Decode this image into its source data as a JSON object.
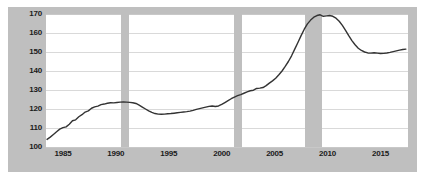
{
  "chart_data": {
    "type": "line",
    "title": "",
    "subtitle": "",
    "xlabel": "",
    "ylabel": "",
    "xlim": [
      1983.4,
      2017.6
    ],
    "ylim": [
      100,
      170
    ],
    "grid": true,
    "legend": "none",
    "y_ticks": [
      100,
      110,
      120,
      130,
      140,
      150,
      160,
      170
    ],
    "y_tick_labels": [
      "100",
      "110",
      "120",
      "130",
      "140",
      "150",
      "160",
      "170"
    ],
    "x_ticks": [
      1985,
      1990,
      1995,
      2000,
      2005,
      2010,
      2015
    ],
    "x_tick_labels": [
      "1985",
      "1990",
      "1995",
      "2000",
      "2005",
      "2010",
      "2015"
    ],
    "line_color": "#333333",
    "line_width": 1.4,
    "plot_background": "#ffffff",
    "figure_background": "#bfbfbf",
    "grid_color": "#d9d9d9",
    "shaded_band_color": "#bfbfbf",
    "shaded_bands": [
      {
        "label": "recession-1990",
        "start": 1990.5,
        "end": 1991.2
      },
      {
        "label": "recession-2001",
        "start": 2001.2,
        "end": 2001.9
      },
      {
        "label": "recession-2008",
        "start": 2007.9,
        "end": 2009.5
      }
    ],
    "series": [
      {
        "name": "index",
        "x": [
          1983.5,
          1983.8,
          1984.1,
          1984.4,
          1984.7,
          1985.0,
          1985.3,
          1985.6,
          1985.9,
          1986.2,
          1986.5,
          1986.8,
          1987.1,
          1987.4,
          1987.7,
          1988.0,
          1988.3,
          1988.6,
          1988.9,
          1989.2,
          1989.5,
          1989.8,
          1990.1,
          1990.4,
          1990.7,
          1991.0,
          1991.3,
          1991.6,
          1991.9,
          1992.2,
          1992.5,
          1992.8,
          1993.1,
          1993.4,
          1993.7,
          1994.0,
          1994.3,
          1994.6,
          1994.9,
          1995.2,
          1995.5,
          1995.8,
          1996.1,
          1996.4,
          1996.7,
          1997.0,
          1997.3,
          1997.6,
          1997.9,
          1998.2,
          1998.5,
          1998.8,
          1999.1,
          1999.4,
          1999.7,
          2000.0,
          2000.3,
          2000.6,
          2000.9,
          2001.2,
          2001.5,
          2001.8,
          2002.1,
          2002.4,
          2002.7,
          2003.0,
          2003.3,
          2003.6,
          2003.9,
          2004.2,
          2004.5,
          2004.8,
          2005.1,
          2005.4,
          2005.7,
          2006.0,
          2006.3,
          2006.6,
          2006.9,
          2007.2,
          2007.5,
          2007.8,
          2008.1,
          2008.4,
          2008.7,
          2009.0,
          2009.3,
          2009.6,
          2009.9,
          2010.2,
          2010.5,
          2010.8,
          2011.1,
          2011.4,
          2011.7,
          2012.0,
          2012.3,
          2012.6,
          2012.9,
          2013.2,
          2013.5,
          2013.8,
          2014.1,
          2014.4,
          2014.7,
          2015.0,
          2015.3,
          2015.6,
          2015.9,
          2016.2,
          2016.5,
          2016.8,
          2017.1,
          2017.4
        ],
        "y": [
          104.0,
          105.2,
          106.6,
          108.0,
          109.4,
          110.2,
          110.6,
          112.0,
          113.8,
          114.3,
          115.9,
          117.0,
          118.4,
          119.0,
          120.4,
          121.1,
          121.5,
          122.3,
          122.6,
          123.0,
          123.3,
          123.2,
          123.4,
          123.6,
          123.7,
          123.6,
          123.5,
          123.3,
          122.9,
          122.0,
          121.0,
          120.0,
          119.0,
          118.2,
          117.6,
          117.3,
          117.2,
          117.3,
          117.5,
          117.6,
          117.8,
          118.0,
          118.2,
          118.4,
          118.6,
          118.9,
          119.3,
          119.8,
          120.2,
          120.6,
          121.0,
          121.4,
          121.6,
          121.3,
          121.6,
          122.4,
          123.4,
          124.4,
          125.4,
          126.3,
          127.0,
          127.6,
          128.3,
          129.0,
          129.6,
          129.9,
          130.8,
          131.0,
          131.3,
          132.3,
          133.6,
          134.8,
          136.2,
          138.0,
          140.0,
          142.4,
          145.0,
          148.0,
          151.5,
          155.0,
          158.6,
          162.0,
          164.8,
          166.8,
          168.3,
          169.2,
          169.6,
          168.8,
          169.0,
          169.2,
          168.8,
          167.8,
          166.2,
          164.0,
          161.4,
          158.6,
          156.0,
          153.8,
          152.0,
          150.8,
          150.0,
          149.5,
          149.4,
          149.6,
          149.4,
          149.2,
          149.3,
          149.5,
          149.8,
          150.2,
          150.6,
          151.0,
          151.3,
          151.5
        ]
      }
    ]
  }
}
